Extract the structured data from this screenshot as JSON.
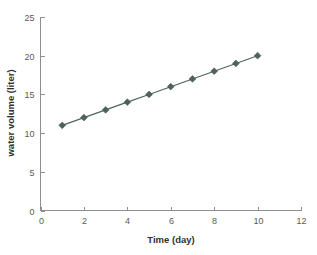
{
  "chart_data": {
    "type": "line",
    "title": "",
    "xlabel": "Time (day)",
    "ylabel": "water volume (liter)",
    "x": [
      1,
      2,
      3,
      4,
      5,
      6,
      7,
      8,
      9,
      10
    ],
    "values": [
      11,
      12,
      13,
      14,
      15,
      16,
      17,
      18,
      19,
      20
    ],
    "series": [
      {
        "name": "water volume",
        "values": [
          11,
          12,
          13,
          14,
          15,
          16,
          17,
          18,
          19,
          20
        ]
      }
    ],
    "xlim": [
      0,
      12
    ],
    "ylim": [
      0,
      25
    ],
    "xticks": [
      0,
      2,
      4,
      6,
      8,
      10,
      12
    ],
    "yticks": [
      0,
      5,
      10,
      15,
      20,
      25
    ],
    "xtick_labels": [
      "0",
      "2",
      "4",
      "6",
      "8",
      "10",
      "12"
    ],
    "ytick_labels": [
      "0",
      "5",
      "10",
      "15",
      "20",
      "25"
    ],
    "grid": false,
    "legend": false,
    "legend_position": "none",
    "marker": "diamond",
    "colors": {
      "series": "#4e6360",
      "axis": "#8f8f8f",
      "tick_label": "#5a5a5a",
      "axis_title": "#2f2f2f",
      "background": "#ffffff"
    }
  }
}
